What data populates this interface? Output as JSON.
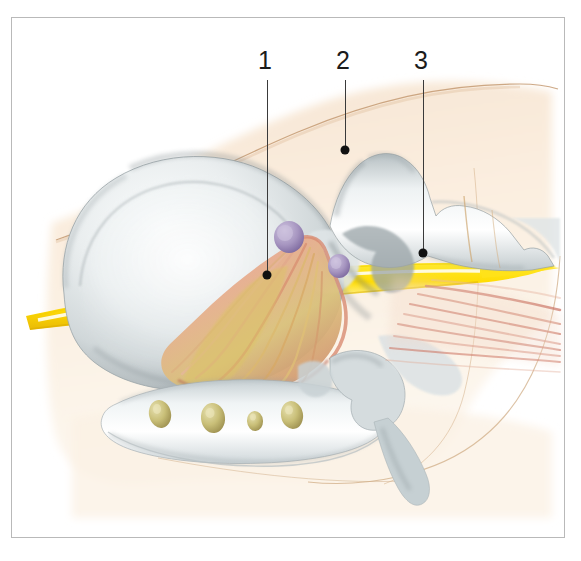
{
  "figure": {
    "kind": "anatomical-illustration",
    "frame": {
      "border_color": "#b9b9b9",
      "background_color": "#ffffff"
    },
    "palette": {
      "paper": "#ffffff",
      "skin_wash": "#f7e6d5",
      "skin_wash_light": "#fbf1e6",
      "skin_outline": "#c9a078",
      "bone_light": "#f2f4f4",
      "bone_mid": "#cfd6d8",
      "bone_shadow": "#8e9699",
      "bone_deep_shadow": "#6b7478",
      "muscle_pink": "#e8a089",
      "muscle_salmon": "#dd8f78",
      "tendon_yellow": "#d9c26a",
      "nerve_yellow": "#ffde00",
      "nerve_yellow_dark": "#e5c400",
      "nerve_highlight": "#fffbe0",
      "node_lavender": "#a797c0",
      "tooth_olive": "#c8bf7d",
      "fiber_red": "#c7695c",
      "leader_line": "#3a3a3a",
      "leader_dot": "#111111",
      "label_text": "#1b1b1b"
    }
  },
  "callouts": [
    {
      "id": "callout-1",
      "label": "1",
      "label_x": 258,
      "label_y": 48,
      "line_x": 267,
      "line_top": 80,
      "line_bottom": 275,
      "dot_x": 267,
      "dot_y": 275,
      "points_to": "masticatory-muscle-origin"
    },
    {
      "id": "callout-2",
      "label": "2",
      "label_x": 336,
      "label_y": 48,
      "line_x": 345,
      "line_top": 80,
      "line_bottom": 150,
      "dot_x": 345,
      "dot_y": 150,
      "points_to": "coronoid-process-tip"
    },
    {
      "id": "callout-3",
      "label": "3",
      "label_x": 414,
      "label_y": 48,
      "line_x": 423,
      "line_top": 80,
      "line_bottom": 253,
      "dot_x": 423,
      "dot_y": 253,
      "points_to": "nerve-trunk"
    }
  ],
  "structures": [
    {
      "name": "skin-contour-upper",
      "color": "#c9a078",
      "description": "soft peach outline sweeping across the upper field"
    },
    {
      "name": "skin-wash-body",
      "color": "#f7e6d5",
      "description": "pale peach soft-tissue wash behind the bones"
    },
    {
      "name": "cranial-bone-mass",
      "color": "#cfd6d8",
      "description": "large rounded bone mass at left (occipital / mastoid region)"
    },
    {
      "name": "coronoid-process",
      "color": "#cfd6d8",
      "description": "upward bone process at upper centre carrying callout 2"
    },
    {
      "name": "zygomatic-arch",
      "color": "#cfd6d8",
      "description": "horizontal bone bar running to the right"
    },
    {
      "name": "mandible-body",
      "color": "#e2e7e8",
      "description": "lower jaw bar with embedded tooth roots"
    },
    {
      "name": "tooth-roots",
      "color": "#c8bf7d",
      "count": 4,
      "description": "four olive tooth roots in the jaw"
    },
    {
      "name": "masticatory-muscle",
      "color": "#e8a089",
      "description": "fan of salmon and yellow muscle/tendon fibres"
    },
    {
      "name": "nerve-trunk",
      "color": "#ffde00",
      "description": "bright yellow nerve band with pale highlight stripe"
    },
    {
      "name": "lymph-nodes",
      "color": "#a797c0",
      "count": 2,
      "description": "two lavender nodules beside the muscle origin"
    },
    {
      "name": "fibre-strands-right",
      "color": "#c7695c",
      "count": 7,
      "description": "reddish fibre strands radiating to the right margin"
    },
    {
      "name": "styloid-hyoid-process",
      "color": "#b9c3c6",
      "description": "slender bone process descending at lower centre-right"
    }
  ]
}
